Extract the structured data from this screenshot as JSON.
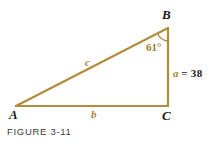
{
  "figure": {
    "caption": "FIGURE 3-11",
    "background_color": "#ffffff",
    "stroke_color": "#b08c3c",
    "label_gold_color": "#a9842f",
    "label_dark_color": "#1a1a1a",
    "width": 219,
    "height": 149
  },
  "vertices": [
    {
      "name": "A",
      "label": "A",
      "x": 16,
      "y": 106,
      "label_x": 9,
      "label_y": 109
    },
    {
      "name": "B",
      "label": "B",
      "x": 168,
      "y": 28,
      "label_x": 163,
      "label_y": 9
    },
    {
      "name": "C",
      "label": "C",
      "x": 168,
      "y": 106,
      "label_x": 163,
      "label_y": 110
    }
  ],
  "sides": [
    {
      "name": "a",
      "label": "a",
      "from": "B",
      "to": "C",
      "measure_text": "a = 38",
      "value": 38,
      "var_text": "a",
      "eq_text": "= 38"
    },
    {
      "name": "b",
      "label": "b",
      "from": "A",
      "to": "C",
      "measure_text": "b"
    },
    {
      "name": "c",
      "label": "c",
      "from": "A",
      "to": "B",
      "measure_text": "c"
    }
  ],
  "angles": [
    {
      "at_vertex": "B",
      "label": "61°",
      "degrees": 61
    },
    {
      "at_vertex": "C",
      "label": "",
      "degrees": 90,
      "marker": "right-angle"
    }
  ]
}
